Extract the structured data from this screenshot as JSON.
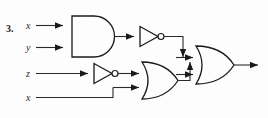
{
  "problem": {
    "number": "3."
  },
  "labels": {
    "in_x_top": "x",
    "in_y": "y",
    "in_z": "z",
    "in_x_bottom": "x"
  },
  "gates": [
    {
      "id": "and1",
      "type": "AND",
      "name": "and-gate"
    },
    {
      "id": "not1",
      "type": "NOT",
      "name": "not-gate-upper"
    },
    {
      "id": "not2",
      "type": "NOT",
      "name": "not-gate-lower"
    },
    {
      "id": "or1",
      "type": "OR",
      "name": "or-gate-lower"
    },
    {
      "id": "or2",
      "type": "OR",
      "name": "or-gate-output"
    }
  ],
  "colors": {
    "ink": "#1a1a1a",
    "wire": "#2a2a2a",
    "background": "#fdfdfd"
  },
  "style": {
    "stroke_width": "1.2",
    "wire_width": "1.1"
  }
}
